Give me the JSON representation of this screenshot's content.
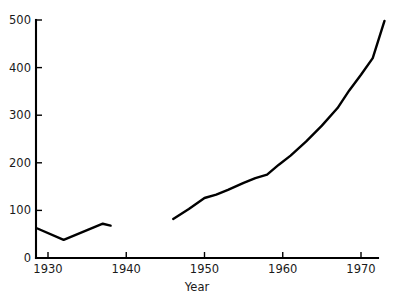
{
  "chart_data": {
    "type": "line",
    "title": "",
    "subtitle": "",
    "xlabel": "Year",
    "ylabel": "",
    "xlim": [
      1928,
      1974
    ],
    "ylim": [
      0,
      500
    ],
    "grid": false,
    "legend": null,
    "x_ticks": [
      1930,
      1940,
      1950,
      1960,
      1970
    ],
    "x_tick_labels": [
      "1930",
      "1940",
      "1950",
      "1960",
      "1970"
    ],
    "y_ticks": [
      0,
      100,
      200,
      300,
      400,
      500
    ],
    "y_tick_labels": [
      "0",
      "100",
      "200",
      "300",
      "400",
      "500"
    ],
    "line_color": "#000000",
    "series": [
      {
        "name": "pre-war",
        "x": [
          1928.5,
          1932.0,
          1937.0,
          1938.0
        ],
        "values": [
          63,
          38,
          72,
          68
        ]
      },
      {
        "name": "post-war",
        "x": [
          1946.0,
          1948.0,
          1950.0,
          1951.5,
          1953.0,
          1955.0,
          1956.5,
          1958.0,
          1959.5,
          1961.0,
          1963.0,
          1965.0,
          1967.0,
          1968.5,
          1970.0,
          1971.5,
          1973.0
        ],
        "values": [
          82,
          103,
          126,
          133,
          143,
          158,
          168,
          175,
          196,
          215,
          245,
          278,
          315,
          352,
          385,
          420,
          498
        ]
      }
    ]
  },
  "axis": {
    "x_title": "Year"
  }
}
